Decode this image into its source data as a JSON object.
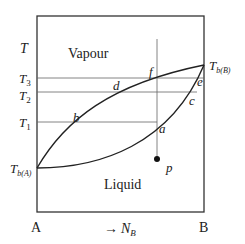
{
  "diagram": {
    "type": "boiling-point phase diagram",
    "regions": {
      "vapour": "Vapour",
      "liquid": "Liquid"
    },
    "y_axis": {
      "label": "T",
      "ticks": [
        {
          "name": "T3",
          "base": "T",
          "sub": "3"
        },
        {
          "name": "T2",
          "base": "T",
          "sub": "2"
        },
        {
          "name": "T1",
          "base": "T",
          "sub": "1"
        }
      ],
      "left_end": {
        "base": "T",
        "sub": "b(A)"
      },
      "right_end": {
        "base": "T",
        "sub": "b(B)"
      }
    },
    "x_axis": {
      "left": "A",
      "right": "B",
      "direction": "→",
      "variable_base": "N",
      "variable_sub": "B"
    },
    "points": {
      "a": "a",
      "b": "b",
      "c": "c",
      "d": "d",
      "e": "e",
      "f": "f",
      "p": "p"
    },
    "colors": {
      "line": "#333333",
      "thin_line": "#555555",
      "text": "#222222"
    }
  }
}
